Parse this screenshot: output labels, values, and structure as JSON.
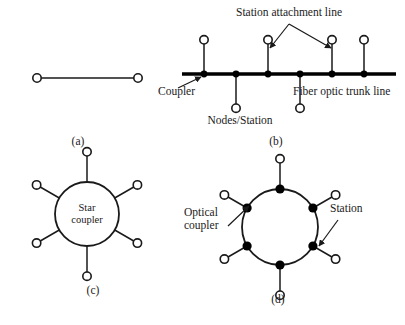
{
  "figure": {
    "background_color": "#ffffff",
    "ink_color": "#1a1a1a",
    "node_fill_color": "#000000",
    "station_fill_color": "#ffffff"
  },
  "panels": [
    {
      "id": "a",
      "label": "(a)",
      "name": "point-to-point-topology",
      "label_x": 78,
      "label_y": 145,
      "description": "Point-to-point link between two stations",
      "stations": [
        {
          "cx": 37,
          "cy": 78,
          "r": 4.2
        },
        {
          "cx": 138,
          "cy": 78,
          "r": 4.2
        }
      ],
      "links": [
        {
          "x1": 41,
          "y1": 78,
          "x2": 134,
          "y2": 78
        }
      ]
    },
    {
      "id": "b",
      "label": "(b)",
      "name": "bus-topology",
      "label_x": 276,
      "label_y": 145,
      "description": "Fiber optic bus with trunk line and station attachment lines",
      "trunk": {
        "x1": 182,
        "y1": 74,
        "x2": 396,
        "y2": 74
      },
      "nodes": [
        {
          "cx": 204,
          "cy": 74,
          "r": 3.4,
          "stub_dir": "up",
          "stub_len": 30
        },
        {
          "cx": 236,
          "cy": 74,
          "r": 3.4,
          "stub_dir": "down",
          "stub_len": 30
        },
        {
          "cx": 268,
          "cy": 74,
          "r": 3.4,
          "stub_dir": "up",
          "stub_len": 30
        },
        {
          "cx": 300,
          "cy": 74,
          "r": 3.4,
          "stub_dir": "down",
          "stub_len": 30
        },
        {
          "cx": 332,
          "cy": 74,
          "r": 3.4,
          "stub_dir": "up",
          "stub_len": 30
        },
        {
          "cx": 364,
          "cy": 74,
          "r": 3.4,
          "stub_dir": "up",
          "stub_len": 30
        }
      ],
      "station_radius": 4.2,
      "callouts": [
        {
          "name": "station-attachment-line",
          "text": "Station attachment line",
          "text_x": 289,
          "text_y": 16,
          "anchor": "middle",
          "fork_x": 289,
          "fork_y": 24,
          "arrows": [
            {
              "x1": 289,
              "y1": 24,
              "x2": 270,
              "y2": 48
            },
            {
              "x1": 289,
              "y1": 24,
              "x2": 331,
              "y2": 48
            }
          ]
        },
        {
          "name": "coupler",
          "text": "Coupler",
          "text_x": 158,
          "text_y": 95,
          "anchor": "start",
          "arrows": [
            {
              "x1": 178,
              "y1": 88,
              "x2": 201,
              "y2": 77
            }
          ]
        },
        {
          "name": "fiber-optic-trunk-line",
          "text": "Fiber optic trunk line",
          "text_x": 293,
          "text_y": 95,
          "anchor": "start",
          "arrows": []
        },
        {
          "name": "nodes-station",
          "text": "Nodes/Station",
          "text_x": 240,
          "text_y": 124,
          "anchor": "middle",
          "arrows": []
        }
      ]
    },
    {
      "id": "c",
      "label": "(c)",
      "name": "star-topology",
      "label_x": 93,
      "label_y": 294,
      "description": "Star topology with a central star coupler",
      "hub": {
        "cx": 87,
        "cy": 214,
        "r": 32,
        "label_line1": "Star",
        "label_line2": "coupler",
        "label_x": 87,
        "label_y1": 211,
        "label_y2": 223
      },
      "spokes": [
        {
          "angle_deg": 270,
          "spoke_len": 26,
          "station_r": 4.2
        },
        {
          "angle_deg": 330,
          "spoke_len": 22,
          "station_r": 4.2
        },
        {
          "angle_deg": 30,
          "spoke_len": 22,
          "station_r": 4.2
        },
        {
          "angle_deg": 90,
          "spoke_len": 26,
          "station_r": 4.2
        },
        {
          "angle_deg": 150,
          "spoke_len": 22,
          "station_r": 4.2
        },
        {
          "angle_deg": 210,
          "spoke_len": 22,
          "station_r": 4.2
        }
      ]
    },
    {
      "id": "d",
      "label": "(d)",
      "name": "ring-topology",
      "label_x": 278,
      "label_y": 303,
      "description": "Ring topology with optical couplers and attached stations",
      "ring": {
        "cx": 280,
        "cy": 227,
        "r": 38
      },
      "couplers": [
        {
          "angle_deg": 270,
          "node_r": 4.6,
          "spoke_len": 26,
          "station_r": 4.2
        },
        {
          "angle_deg": 330,
          "node_r": 4.6,
          "spoke_len": 22,
          "station_r": 4.2
        },
        {
          "angle_deg": 30,
          "node_r": 4.6,
          "spoke_len": 22,
          "station_r": 4.2
        },
        {
          "angle_deg": 90,
          "node_r": 4.6,
          "spoke_len": 26,
          "station_r": 4.2
        },
        {
          "angle_deg": 150,
          "node_r": 4.6,
          "spoke_len": 22,
          "station_r": 4.2
        },
        {
          "angle_deg": 210,
          "node_r": 4.6,
          "spoke_len": 22,
          "station_r": 4.2
        }
      ],
      "callouts": [
        {
          "name": "optical-coupler",
          "text_line1": "Optical",
          "text_line2": "coupler",
          "text_x": 184,
          "text_y1": 216,
          "text_y2": 229,
          "anchor": "start",
          "arrows": [
            {
              "x1": 228,
              "y1": 226,
              "x2": 249,
              "y2": 206
            }
          ]
        },
        {
          "name": "station",
          "text_line1": "Station",
          "text_line2": "",
          "text_x": 330,
          "text_y1": 212,
          "text_y2": 0,
          "anchor": "start",
          "arrows": [
            {
              "x1": 338,
              "y1": 220,
              "x2": 319,
              "y2": 246
            }
          ]
        }
      ]
    }
  ]
}
